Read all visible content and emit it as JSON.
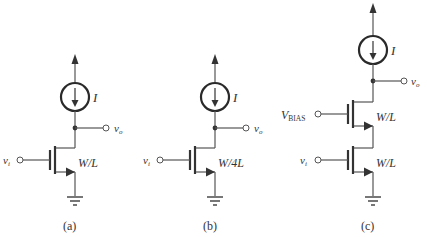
{
  "figure": {
    "circuits": [
      {
        "id": "a",
        "caption": "(a)",
        "current_source_label": "I",
        "output_label": "v",
        "output_sub": "o",
        "transistors": [
          {
            "input_label": "v",
            "input_sub": "i",
            "size_label": "W/L"
          }
        ]
      },
      {
        "id": "b",
        "caption": "(b)",
        "current_source_label": "I",
        "output_label": "v",
        "output_sub": "o",
        "transistors": [
          {
            "input_label": "v",
            "input_sub": "i",
            "size_label": "W/4L"
          }
        ]
      },
      {
        "id": "c",
        "caption": "(c)",
        "current_source_label": "I",
        "output_label": "v",
        "output_sub": "o",
        "transistors": [
          {
            "input_label": "V",
            "input_sub": "BIAS",
            "size_label": "W/L"
          },
          {
            "input_label": "v",
            "input_sub": "i",
            "size_label": "W/L"
          }
        ]
      }
    ],
    "colors": {
      "line": "#555555",
      "text": "#333333",
      "background": "#ffffff"
    }
  }
}
